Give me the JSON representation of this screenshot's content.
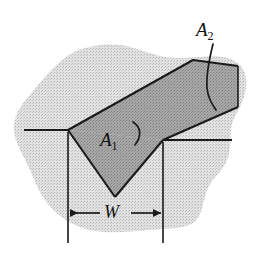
{
  "figure": {
    "type": "engineering-cross-section-diagram",
    "background_color": "#ffffff",
    "labels": {
      "area_groove": {
        "base": "A",
        "sub": "1",
        "full": "A1",
        "meaning": "groove area"
      },
      "area_reinforcement": {
        "base": "A",
        "sub": "2",
        "full": "A2",
        "meaning": "reinforcement band area"
      },
      "width": {
        "base": "W",
        "sub": "",
        "full": "W",
        "meaning": "groove width dimension"
      }
    },
    "regions": [
      {
        "name": "base-metal-blob",
        "description": "irregular light gray stippled base metal section",
        "fill": "#d6d6d6",
        "stroke": "none"
      },
      {
        "name": "groove-triangle-A1",
        "description": "downward pointing V-groove triangle, medium gray",
        "fill": "#a3a3a3",
        "stroke": "#1a1a1a"
      },
      {
        "name": "reinforcement-band-A2",
        "description": "inclined parallelogram band running up to the right, medium gray",
        "fill": "#a3a3a3",
        "stroke": "#1a1a1a"
      }
    ],
    "dimension": {
      "name": "width-dimension-W",
      "style": "double-headed-arrow",
      "extension_lines": 2,
      "label": "W"
    },
    "leaders": [
      {
        "name": "leader-a1",
        "style": "curved",
        "target": "groove-triangle-A1"
      },
      {
        "name": "leader-a2",
        "style": "curved",
        "target": "reinforcement-band-A2"
      }
    ],
    "colors": {
      "line": "#1a1a1a",
      "light_gray": "#d6d6d6",
      "mid_gray": "#a3a3a3",
      "text": "#111111"
    }
  }
}
